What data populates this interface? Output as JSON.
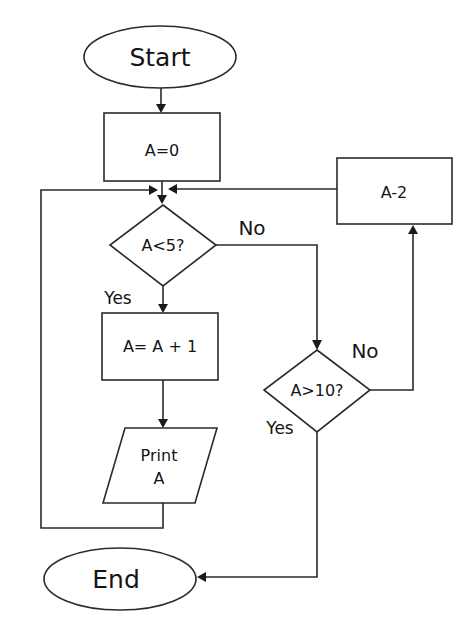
{
  "diagram": {
    "type": "flowchart",
    "nodes": {
      "start": {
        "shape": "terminator",
        "label": "Start"
      },
      "init": {
        "shape": "process",
        "label": "A=0"
      },
      "check_lt5": {
        "shape": "decision",
        "label": "A<5?"
      },
      "increment": {
        "shape": "process",
        "label": "A= A + 1"
      },
      "print": {
        "shape": "input-output",
        "line1": "Print",
        "line2": "A"
      },
      "check_gt10": {
        "shape": "decision",
        "label": "A>10?"
      },
      "decrement": {
        "shape": "process",
        "label": "A-2"
      },
      "end": {
        "shape": "terminator",
        "label": "End"
      }
    },
    "edge_labels": {
      "lt5_yes": "Yes",
      "lt5_no": "No",
      "gt10_yes": "Yes",
      "gt10_no": "No"
    },
    "edges": [
      {
        "from": "Start",
        "to": "A=0"
      },
      {
        "from": "A=0",
        "to": "A<5?"
      },
      {
        "from": "A<5?",
        "to": "A= A + 1",
        "label": "Yes"
      },
      {
        "from": "A<5?",
        "to": "A>10?",
        "label": "No"
      },
      {
        "from": "A= A + 1",
        "to": "Print A"
      },
      {
        "from": "Print A",
        "to": "A<5?",
        "note": "loop back via left side"
      },
      {
        "from": "A>10?",
        "to": "End",
        "label": "Yes"
      },
      {
        "from": "A>10?",
        "to": "A-2",
        "label": "No"
      },
      {
        "from": "A-2",
        "to": "A<5?",
        "note": "loop back via top"
      }
    ],
    "colors": {
      "stroke": "#2a2a2a",
      "text": "#151515",
      "background": "#ffffff"
    }
  }
}
